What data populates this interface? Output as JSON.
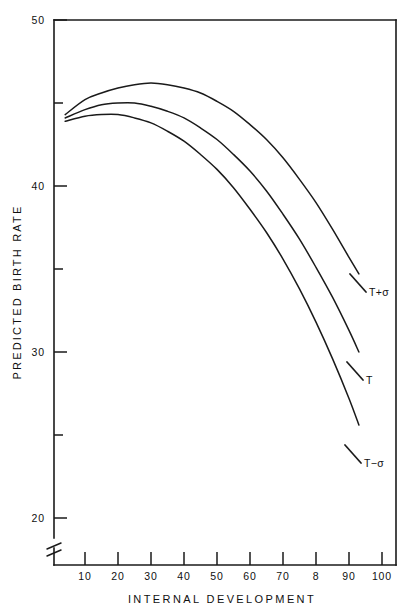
{
  "chart_data": {
    "type": "line",
    "title": "",
    "xlabel": "INTERNAL DEVELOPMENT",
    "ylabel": "PREDICTED BIRTH RATE",
    "xlim": [
      0,
      103
    ],
    "ylim": [
      20,
      50
    ],
    "y_axis_break": true,
    "grid": false,
    "legend_position": "right-inline-labels",
    "xticks": [
      10,
      20,
      30,
      40,
      50,
      60,
      70,
      80,
      90,
      100
    ],
    "xtick_labels": [
      "10",
      "20",
      "30",
      "40",
      "50",
      "60",
      "70",
      "8",
      "90",
      "100"
    ],
    "yticks": [
      20,
      25,
      30,
      35,
      40,
      45,
      50
    ],
    "ytick_labels": [
      "20",
      "",
      "30",
      "",
      "40",
      "",
      "50"
    ],
    "ytick_major": [
      20,
      30,
      40,
      50
    ],
    "ytick_minor": [
      25,
      35,
      45
    ],
    "series": [
      {
        "name": "T+σ",
        "label": "T+σ",
        "x": [
          4,
          10,
          15,
          20,
          25,
          30,
          35,
          40,
          45,
          50,
          55,
          60,
          65,
          70,
          75,
          80,
          85,
          90,
          93
        ],
        "y": [
          44.3,
          45.2,
          45.6,
          45.9,
          46.1,
          46.2,
          46.1,
          45.9,
          45.6,
          45.1,
          44.5,
          43.7,
          42.8,
          41.7,
          40.4,
          39.0,
          37.4,
          35.7,
          34.7
        ]
      },
      {
        "name": "T",
        "label": "T",
        "x": [
          4,
          10,
          15,
          20,
          25,
          30,
          35,
          40,
          45,
          50,
          55,
          60,
          65,
          70,
          75,
          80,
          85,
          90,
          93
        ],
        "y": [
          44.1,
          44.6,
          44.9,
          45.0,
          45.0,
          44.8,
          44.5,
          44.1,
          43.5,
          42.8,
          41.9,
          40.9,
          39.7,
          38.3,
          36.8,
          35.1,
          33.3,
          31.3,
          30.0
        ]
      },
      {
        "name": "T−σ",
        "label": "T−σ",
        "x": [
          4,
          10,
          15,
          20,
          25,
          30,
          35,
          40,
          45,
          50,
          55,
          60,
          65,
          70,
          75,
          80,
          85,
          90,
          93
        ],
        "y": [
          43.9,
          44.2,
          44.3,
          44.3,
          44.1,
          43.8,
          43.3,
          42.7,
          41.9,
          41.0,
          39.9,
          38.6,
          37.2,
          35.6,
          33.8,
          31.8,
          29.6,
          27.2,
          25.6
        ]
      }
    ]
  },
  "axes": {
    "x_title": "INTERNAL DEVELOPMENT",
    "y_title": "PREDICTED BIRTH RATE"
  },
  "xtick_labels": {
    "t10": "10",
    "t20": "20",
    "t30": "30",
    "t40": "40",
    "t50": "50",
    "t60": "60",
    "t70": "70",
    "t80": "8",
    "t90": "90",
    "t100": "100"
  },
  "ytick_labels": {
    "t50": "50",
    "t40": "40",
    "t30": "30",
    "t20": "20"
  },
  "curve_labels": {
    "upper": "T+σ",
    "middle": "T",
    "lower": "T−σ"
  },
  "colors": {
    "ink": "#1a1a1a",
    "background": "#ffffff"
  }
}
